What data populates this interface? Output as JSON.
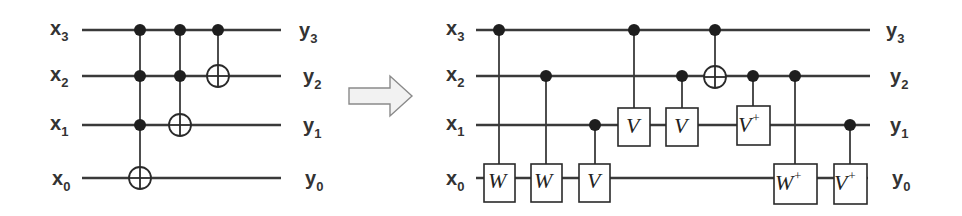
{
  "left_circuit": {
    "inputs": [
      {
        "base": "x",
        "sub": "3",
        "y": 30
      },
      {
        "base": "x",
        "sub": "2",
        "y": 76
      },
      {
        "base": "x",
        "sub": "1",
        "y": 125
      },
      {
        "base": "x",
        "sub": "0",
        "y": 180
      }
    ],
    "outputs": [
      {
        "base": "y",
        "sub": "3"
      },
      {
        "base": "y",
        "sub": "2"
      },
      {
        "base": "y",
        "sub": "1"
      },
      {
        "base": "y",
        "sub": "0"
      }
    ],
    "gates": [
      {
        "type": "toffoli",
        "x": 140,
        "controls": [
          "x3",
          "x2",
          "x1"
        ],
        "target": "x0"
      },
      {
        "type": "toffoli",
        "x": 180,
        "controls": [
          "x3",
          "x2"
        ],
        "target": "x1"
      },
      {
        "type": "cnot",
        "x": 218,
        "controls": [
          "x3"
        ],
        "target": "x2"
      }
    ]
  },
  "transform_arrow": {
    "icon": "right-arrow-icon"
  },
  "right_circuit": {
    "inputs": [
      {
        "base": "x",
        "sub": "3"
      },
      {
        "base": "x",
        "sub": "2"
      },
      {
        "base": "x",
        "sub": "1"
      },
      {
        "base": "x",
        "sub": "0"
      }
    ],
    "outputs": [
      {
        "base": "y",
        "sub": "3"
      },
      {
        "base": "y",
        "sub": "2"
      },
      {
        "base": "y",
        "sub": "1"
      },
      {
        "base": "y",
        "sub": "0"
      }
    ],
    "gates": [
      {
        "label": "W",
        "sup": "",
        "x": 499,
        "control": "x3",
        "target": "x0"
      },
      {
        "label": "W",
        "sup": "",
        "x": 546,
        "control": "x2",
        "target": "x0"
      },
      {
        "label": "V",
        "sup": "",
        "x": 595,
        "control": "x1",
        "target": "x0"
      },
      {
        "label": "V",
        "sup": "",
        "x": 634,
        "control": "x3",
        "target": "x1"
      },
      {
        "label": "V",
        "sup": "",
        "x": 682,
        "control": "x2",
        "target": "x1"
      },
      {
        "label": "⊕",
        "sup": "",
        "x": 715,
        "control": "x3",
        "target": "x2"
      },
      {
        "label": "V",
        "sup": "+",
        "x": 753,
        "control": "x2",
        "target": "x1"
      },
      {
        "label": "W",
        "sup": "+",
        "x": 795,
        "control": "x2",
        "target": "x0"
      },
      {
        "label": "V",
        "sup": "+",
        "x": 850,
        "control": "x1",
        "target": "x0"
      }
    ]
  }
}
